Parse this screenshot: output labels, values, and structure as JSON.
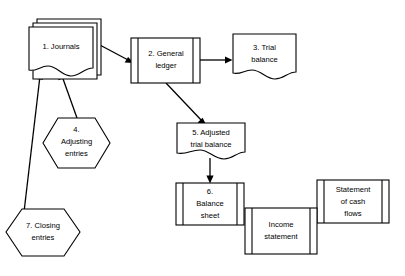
{
  "diagram": {
    "type": "flowchart",
    "background_color": "#ffffff",
    "line_color": "#000000",
    "nodes": {
      "journals": {
        "id": "1",
        "shape": "stacked-document",
        "line1": "1. Journals"
      },
      "general_ledger": {
        "id": "2",
        "shape": "magnetic-tape-box",
        "line1": "2. General",
        "line2": "ledger"
      },
      "trial_balance": {
        "id": "3",
        "shape": "document",
        "line1": "3. Trial",
        "line2": "balance"
      },
      "adjusting_entries": {
        "id": "4",
        "shape": "hexagon",
        "line1": "4.",
        "line2": "Adjusting",
        "line3": "entries"
      },
      "adjusted_trial_balance": {
        "id": "5",
        "shape": "document",
        "line1": "5. Adjusted",
        "line2": "trial balance"
      },
      "balance_sheet": {
        "id": "6",
        "shape": "magnetic-tape-box",
        "line1": "6.",
        "line2": "Balance",
        "line3": "sheet"
      },
      "income_statement": {
        "id": "",
        "shape": "magnetic-tape-box",
        "line1": "Income",
        "line2": "statement"
      },
      "statement_of_cash_flows": {
        "id": "",
        "shape": "magnetic-tape-box",
        "line1": "Statement",
        "line2": "of cash",
        "line3": "flows"
      },
      "closing_entries": {
        "id": "7",
        "shape": "hexagon",
        "line1": "7. Closing",
        "line2": "entries"
      }
    },
    "edges": [
      {
        "name": "journals-to-general-ledger",
        "from": "journals",
        "to": "general_ledger"
      },
      {
        "name": "general-ledger-to-trial-balance",
        "from": "general_ledger",
        "to": "trial_balance"
      },
      {
        "name": "general-ledger-to-adjusted-trial-balance",
        "from": "general_ledger",
        "to": "adjusted_trial_balance"
      },
      {
        "name": "adjusted-trial-balance-to-balance-sheet",
        "from": "adjusted_trial_balance",
        "to": "balance_sheet"
      },
      {
        "name": "adjusting-entries-to-journals",
        "from": "adjusting_entries",
        "to": "journals"
      },
      {
        "name": "closing-entries-to-journals",
        "from": "closing_entries",
        "to": "journals"
      }
    ]
  }
}
